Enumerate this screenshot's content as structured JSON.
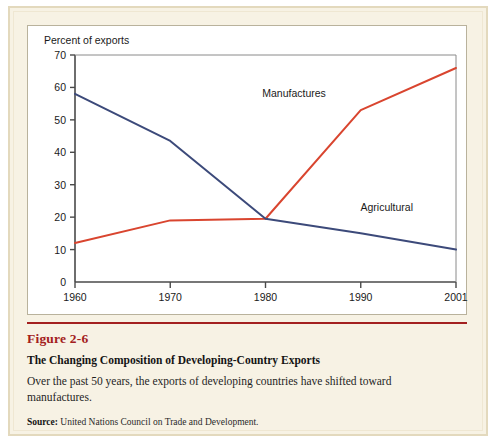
{
  "figure": {
    "number": "Figure 2-6",
    "title": "The Changing Composition of Developing-Country Exports",
    "description": "Over the past 50 years, the exports of developing countries have shifted toward manufactures.",
    "source_label": "Source:",
    "source_text": "United Nations Council on Trade and Development."
  },
  "colors": {
    "manufactures": "#d9452f",
    "agricultural": "#3c4a7a",
    "accent_red": "#a32020",
    "panel_bg": "#f7f2e4",
    "plot_bg": "#ffffff",
    "frame_border": "#e3d9bd",
    "axis": "#4a4a4a"
  },
  "chart_data": {
    "type": "line",
    "title": "",
    "xlabel": "",
    "ylabel": "Percent of exports",
    "x": [
      1960,
      1970,
      1980,
      1990,
      2001
    ],
    "xticklabels": [
      "1960",
      "1970",
      "1980",
      "1990",
      "2001"
    ],
    "yticks": [
      0,
      10,
      20,
      30,
      40,
      50,
      60,
      70
    ],
    "yticklabels": [
      "0",
      "10",
      "20",
      "30",
      "40",
      "50",
      "60",
      "70"
    ],
    "ylim": [
      0,
      70
    ],
    "grid": false,
    "legend": "inline-annotations",
    "series": [
      {
        "name": "Manufactures",
        "color": "#d9452f",
        "values": [
          12,
          19,
          19.5,
          53,
          66
        ],
        "label_x": 1983,
        "label_y": 57
      },
      {
        "name": "Agricultural",
        "color": "#3c4a7a",
        "values": [
          58,
          43.5,
          19.5,
          15,
          10
        ],
        "label_x": 1993,
        "label_y": 22
      }
    ]
  }
}
